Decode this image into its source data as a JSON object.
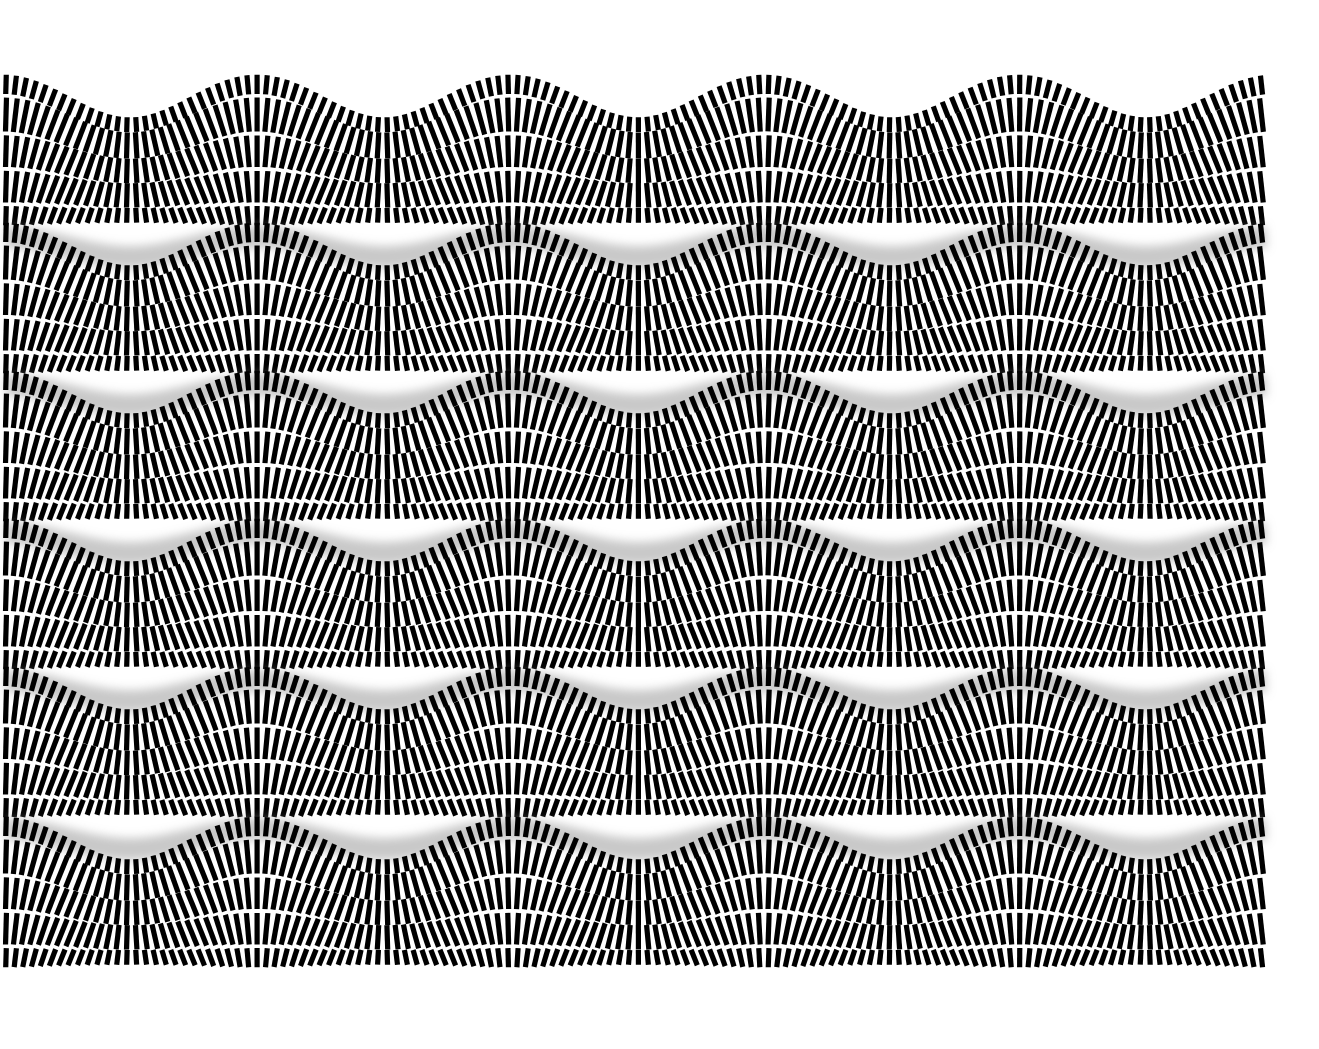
{
  "canvas": {
    "width": 1319,
    "height": 1049,
    "background": "#ffffff"
  },
  "pattern": {
    "x_start": 6,
    "x_end": 1268,
    "bar_pitch": 9.3,
    "bar_width": 5.2,
    "bar_color": "#000000",
    "wave": {
      "period": 254,
      "amplitude": 10,
      "phase_x": 130
    },
    "bands": [
      {
        "top": 96
      },
      {
        "top": 244
      },
      {
        "top": 392
      },
      {
        "top": 540
      },
      {
        "top": 688
      },
      {
        "top": 838
      }
    ],
    "rows": [
      {
        "offset": 0,
        "height": 17
      },
      {
        "offset": 19,
        "height": 30
      },
      {
        "offset": 51,
        "height": 28
      },
      {
        "offset": 81,
        "height": 28
      },
      {
        "offset": 111,
        "height": 17
      }
    ],
    "separator": {
      "offset": 140,
      "height": 22,
      "color": "#9a9a9a",
      "blur": 5
    }
  }
}
